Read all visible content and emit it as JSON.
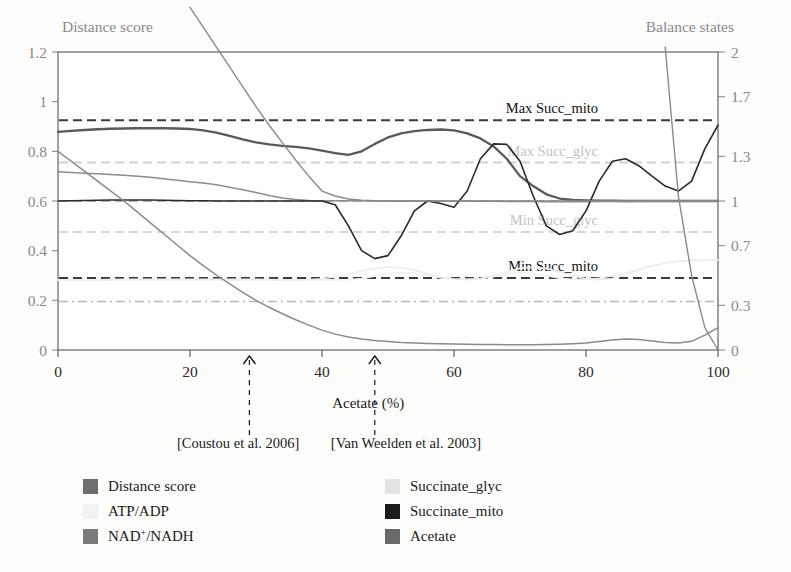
{
  "figure": {
    "left_axis_title": "Distance score",
    "right_axis_title": "Balance states",
    "x_axis_title": "Acetate (%)"
  },
  "annotations": [
    {
      "name": "coustou",
      "label": "[Coustou et al. 2006]",
      "x_value": 29
    },
    {
      "name": "vanweelden",
      "label": "[Van Weelden et al. 2003]",
      "x_value": 48
    }
  ],
  "reference_lines": [
    {
      "name": "max-succ-mito",
      "label": "Max Succ_mito",
      "y_value": 0.925,
      "style": "dashed",
      "color": "#3a3a3a",
      "label_color": "dark"
    },
    {
      "name": "max-succ-glyc",
      "label": "Max Succ_glyc",
      "y_value": 0.755,
      "style": "dashed",
      "color": "#d0d0d0",
      "label_color": "light"
    },
    {
      "name": "min-succ-glyc",
      "label": "Min Succ_glyc",
      "y_value": 0.475,
      "style": "dashed",
      "color": "#d8d8d8",
      "label_color": "light"
    },
    {
      "name": "min-succ-mito",
      "label": "Min Succ_mito",
      "y_value": 0.29,
      "style": "dashed",
      "color": "#3a3a3a",
      "label_color": "dark"
    },
    {
      "name": "balance-unity",
      "label": "",
      "y_value": 0.6,
      "style": "dashed",
      "color": "#9a9a9a",
      "label_color": "light"
    },
    {
      "name": "lower-dashdot",
      "label": "",
      "y_value": 0.195,
      "style": "dashdot",
      "color": "#b9b9b9",
      "label_color": "light"
    }
  ],
  "legend": {
    "items": [
      {
        "name": "distance-score",
        "label": "Distance score",
        "color": "#6e6e6e",
        "swatch": true
      },
      {
        "name": "atp-adp",
        "label": "ATP/ADP",
        "color": "#f2f2f2",
        "swatch": true
      },
      {
        "name": "nad-nadh",
        "label": "NAD+/NADH",
        "color": "#7a7a7a",
        "swatch": true,
        "superscript": "+"
      },
      {
        "name": "succinate-glyc",
        "label": "Succinate_glyc",
        "color": "#e3e3e3",
        "swatch": true
      },
      {
        "name": "succinate-mito",
        "label": "Succinate_mito",
        "color": "#1c1c1c",
        "swatch": true
      },
      {
        "name": "acetate",
        "label": "Acetate",
        "color": "#6a6a6a",
        "swatch": true
      }
    ]
  },
  "chart_data": {
    "type": "line",
    "title": "",
    "xlabel": "Acetate (%)",
    "ylabel": "Distance score",
    "y2label": "Balance states",
    "xlim": [
      0,
      100
    ],
    "ylim": [
      0,
      1.2
    ],
    "y2lim": [
      0,
      2
    ],
    "grid": false,
    "legend_position": "bottom",
    "xticks": [
      0,
      20,
      40,
      60,
      80,
      100
    ],
    "yticks": [
      0,
      0.2,
      0.4,
      0.6,
      0.8,
      1,
      1.2
    ],
    "y2ticks": [
      0,
      0.3,
      0.7,
      1,
      1.3,
      1.7,
      2
    ],
    "x": [
      0,
      2,
      4,
      6,
      8,
      10,
      12,
      14,
      16,
      18,
      20,
      22,
      24,
      26,
      28,
      30,
      32,
      34,
      36,
      38,
      40,
      42,
      44,
      46,
      48,
      50,
      52,
      54,
      56,
      58,
      60,
      62,
      64,
      66,
      68,
      70,
      72,
      74,
      76,
      78,
      80,
      82,
      84,
      86,
      88,
      90,
      92,
      94,
      96,
      98,
      100
    ],
    "series": [
      {
        "name": "Distance score",
        "axis": "left",
        "color": "#5a5a5a",
        "width": 2.3,
        "values": [
          0.878,
          0.882,
          0.886,
          0.889,
          0.891,
          0.892,
          0.893,
          0.893,
          0.893,
          0.892,
          0.89,
          0.884,
          0.875,
          0.862,
          0.848,
          0.836,
          0.828,
          0.822,
          0.818,
          0.812,
          0.803,
          0.793,
          0.786,
          0.8,
          0.83,
          0.856,
          0.872,
          0.881,
          0.886,
          0.888,
          0.884,
          0.872,
          0.852,
          0.82,
          0.77,
          0.7,
          0.66,
          0.627,
          0.61,
          0.604,
          0.602,
          0.601,
          0.601,
          0.6,
          0.6,
          0.6,
          0.6,
          0.6,
          0.6,
          0.6,
          0.6
        ]
      },
      {
        "name": "ATP/ADP",
        "axis": "right",
        "color": "#f0f0f0",
        "width": 1.5,
        "values": [
          0.47,
          0.47,
          0.471,
          0.472,
          0.473,
          0.474,
          0.474,
          0.475,
          0.475,
          0.475,
          0.475,
          0.475,
          0.475,
          0.475,
          0.474,
          0.474,
          0.473,
          0.472,
          0.471,
          0.47,
          0.469,
          0.469,
          0.472,
          0.48,
          0.495,
          0.512,
          0.52,
          0.516,
          0.5,
          0.484,
          0.476,
          0.474,
          0.478,
          0.492,
          0.51,
          0.52,
          0.515,
          0.498,
          0.482,
          0.474,
          0.474,
          0.482,
          0.498,
          0.518,
          0.54,
          0.565,
          0.585,
          0.598,
          0.602,
          0.602,
          0.602
        ]
      },
      {
        "name": "NAD+/NADH",
        "axis": "left",
        "color": "#8c8c8c",
        "width": 1.5,
        "values": [
          0.718,
          0.715,
          0.712,
          0.71,
          0.707,
          0.704,
          0.7,
          0.696,
          0.69,
          0.684,
          0.678,
          0.672,
          0.665,
          0.655,
          0.645,
          0.634,
          0.622,
          0.612,
          0.606,
          0.602,
          0.601,
          0.601,
          0.601,
          0.601,
          0.6,
          0.6,
          0.6,
          0.6,
          0.6,
          0.6,
          0.6,
          0.6,
          0.599,
          0.599,
          0.598,
          0.598,
          0.598,
          0.597,
          0.597,
          0.597,
          0.597,
          0.598,
          0.598,
          0.598,
          0.599,
          0.6,
          0.6,
          0.6,
          0.6,
          0.6,
          0.6
        ]
      },
      {
        "name": "Succinate_glyc",
        "axis": "right",
        "color": "#ededed",
        "width": 1.6,
        "values": [
          0.47,
          0.47,
          0.47,
          0.47,
          0.47,
          0.47,
          0.47,
          0.47,
          0.47,
          0.47,
          0.47,
          0.47,
          0.47,
          0.47,
          0.47,
          0.47,
          0.47,
          0.47,
          0.47,
          0.472,
          0.478,
          0.49,
          0.508,
          0.53,
          0.548,
          0.556,
          0.552,
          0.536,
          0.512,
          0.49,
          0.476,
          0.472,
          0.48,
          0.5,
          0.526,
          0.548,
          0.556,
          0.548,
          0.524,
          0.498,
          0.478,
          0.472,
          0.48,
          0.504,
          0.536,
          0.564,
          0.582,
          0.594,
          0.6,
          0.602,
          0.602
        ]
      },
      {
        "name": "Succinate_mito",
        "axis": "left",
        "color": "#2b2b2b",
        "width": 1.6,
        "values": [
          0.6,
          0.601,
          0.602,
          0.603,
          0.604,
          0.604,
          0.604,
          0.604,
          0.603,
          0.602,
          0.601,
          0.601,
          0.6,
          0.6,
          0.6,
          0.6,
          0.6,
          0.6,
          0.6,
          0.6,
          0.6,
          0.585,
          0.5,
          0.4,
          0.368,
          0.38,
          0.46,
          0.56,
          0.6,
          0.59,
          0.575,
          0.64,
          0.77,
          0.83,
          0.828,
          0.76,
          0.62,
          0.5,
          0.465,
          0.48,
          0.56,
          0.68,
          0.76,
          0.77,
          0.742,
          0.7,
          0.66,
          0.64,
          0.68,
          0.81,
          0.905
        ]
      },
      {
        "name": "Acetate",
        "axis": "left",
        "color": "#8a8a8a",
        "width": 1.5,
        "values": [
          0.8,
          0.76,
          0.72,
          0.68,
          0.64,
          0.6,
          0.556,
          0.512,
          0.468,
          0.424,
          0.38,
          0.34,
          0.302,
          0.266,
          0.232,
          0.2,
          0.172,
          0.146,
          0.122,
          0.1,
          0.08,
          0.064,
          0.052,
          0.044,
          0.038,
          0.034,
          0.03,
          0.028,
          0.026,
          0.025,
          0.024,
          0.023,
          0.022,
          0.022,
          0.021,
          0.021,
          0.021,
          0.022,
          0.023,
          0.025,
          0.028,
          0.034,
          0.04,
          0.044,
          0.042,
          0.036,
          0.03,
          0.028,
          0.035,
          0.06,
          0.09
        ]
      },
      {
        "name": "steep-left",
        "axis": "left",
        "color": "#8a8a8a",
        "width": 1.4,
        "values": [
          null,
          null,
          null,
          null,
          null,
          null,
          null,
          null,
          null,
          null,
          1.38,
          1.3,
          1.22,
          1.14,
          1.06,
          0.98,
          0.905,
          0.835,
          0.765,
          0.7,
          0.64,
          0.62,
          0.608,
          0.603,
          0.601,
          0.6,
          0.6,
          0.6,
          0.6,
          0.6,
          0.6,
          0.6,
          0.6,
          0.6,
          0.6,
          0.6,
          0.6,
          0.6,
          0.6,
          0.6,
          0.6,
          0.6,
          0.6,
          0.6,
          0.6,
          0.6,
          0.6,
          0.6,
          0.6,
          0.6,
          0.6
        ]
      },
      {
        "name": "steep-right",
        "axis": "left",
        "color": "#8a8a8a",
        "width": 1.4,
        "values": [
          null,
          null,
          null,
          null,
          null,
          null,
          null,
          null,
          null,
          null,
          null,
          null,
          null,
          null,
          null,
          null,
          null,
          null,
          null,
          null,
          null,
          null,
          null,
          null,
          null,
          null,
          null,
          null,
          null,
          null,
          null,
          null,
          null,
          null,
          null,
          null,
          null,
          null,
          null,
          null,
          null,
          null,
          null,
          null,
          null,
          null,
          1.22,
          0.62,
          0.3,
          0.09,
          0.0
        ]
      }
    ]
  }
}
